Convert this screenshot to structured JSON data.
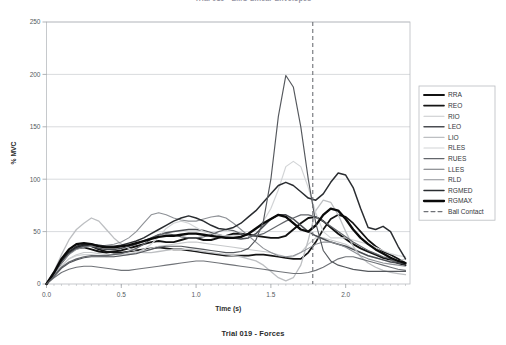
{
  "figure": {
    "top_title": "Trial 019 - EMG Linear Envelopes",
    "bottom_caption": "Trial 019 - Forces"
  },
  "chart_data": {
    "type": "line",
    "title": "Trial 019 - EMG Linear Envelopes",
    "xlabel": "Time (s)",
    "ylabel": "% MVC",
    "xlim": [
      0.0,
      2.43
    ],
    "ylim": [
      0,
      250
    ],
    "xticks": [
      "0.0",
      "0.5",
      "1.0",
      "1.5",
      "2.0"
    ],
    "xtick_values": [
      0.0,
      0.5,
      1.0,
      1.5,
      2.0
    ],
    "yticks": [
      "0",
      "50",
      "100",
      "150",
      "200",
      "250"
    ],
    "ytick_values": [
      0,
      50,
      100,
      150,
      200,
      250
    ],
    "grid": "horizontal",
    "legend_position": "right-outside",
    "annotations": [
      {
        "name": "Ball Contact",
        "type": "vline",
        "x": 1.78,
        "style": "dashed",
        "color": "#6f7277"
      }
    ],
    "x": [
      0.0,
      0.05,
      0.1,
      0.15,
      0.2,
      0.25,
      0.3,
      0.35,
      0.4,
      0.45,
      0.5,
      0.55,
      0.6,
      0.65,
      0.7,
      0.75,
      0.8,
      0.85,
      0.9,
      0.95,
      1.0,
      1.05,
      1.1,
      1.15,
      1.2,
      1.25,
      1.3,
      1.35,
      1.4,
      1.45,
      1.5,
      1.55,
      1.6,
      1.65,
      1.7,
      1.75,
      1.8,
      1.85,
      1.9,
      1.95,
      2.0,
      2.05,
      2.1,
      2.15,
      2.2,
      2.25,
      2.3,
      2.35,
      2.4
    ],
    "series": [
      {
        "name": "RRA",
        "color": "#111111",
        "width": 1.9,
        "values": [
          0,
          10,
          22,
          30,
          34,
          35,
          33,
          31,
          30,
          31,
          32,
          34,
          36,
          38,
          40,
          41,
          40,
          40,
          42,
          44,
          44,
          42,
          42,
          44,
          46,
          48,
          48,
          47,
          46,
          45,
          44,
          44,
          46,
          52,
          58,
          63,
          64,
          60,
          54,
          48,
          43,
          38,
          34,
          31,
          28,
          25,
          23,
          20,
          18
        ]
      },
      {
        "name": "REO",
        "color": "#141414",
        "width": 1.7,
        "values": [
          0,
          9,
          20,
          29,
          35,
          37,
          36,
          33,
          31,
          30,
          30,
          31,
          32,
          33,
          34,
          35,
          34,
          33,
          33,
          32,
          31,
          30,
          29,
          28,
          27,
          27,
          27,
          27,
          28,
          28,
          27,
          26,
          25,
          24,
          24,
          30,
          40,
          52,
          62,
          66,
          64,
          58,
          50,
          42,
          36,
          31,
          28,
          24,
          20
        ]
      },
      {
        "name": "RIO",
        "color": "#c7c9cb",
        "width": 1.1,
        "values": [
          0,
          8,
          17,
          24,
          28,
          30,
          30,
          29,
          28,
          28,
          28,
          29,
          30,
          32,
          34,
          36,
          37,
          38,
          39,
          40,
          40,
          39,
          38,
          37,
          36,
          35,
          34,
          33,
          32,
          31,
          30,
          28,
          26,
          26,
          30,
          38,
          44,
          44,
          42,
          40,
          38,
          34,
          30,
          27,
          25,
          23,
          22,
          22,
          24
        ]
      },
      {
        "name": "LEO",
        "color": "#4a4d52",
        "width": 1.5,
        "values": [
          0,
          10,
          21,
          29,
          34,
          36,
          36,
          34,
          33,
          33,
          34,
          36,
          38,
          41,
          44,
          47,
          49,
          50,
          51,
          52,
          52,
          51,
          49,
          47,
          45,
          44,
          43,
          44,
          48,
          55,
          62,
          66,
          66,
          62,
          56,
          50,
          46,
          43,
          40,
          38,
          36,
          33,
          30,
          27,
          25,
          23,
          21,
          20,
          19
        ]
      },
      {
        "name": "LIO",
        "color": "#bdbfc2",
        "width": 1.3,
        "values": [
          0,
          12,
          28,
          42,
          52,
          58,
          63,
          60,
          52,
          44,
          38,
          34,
          31,
          30,
          30,
          31,
          32,
          33,
          33,
          33,
          32,
          31,
          30,
          29,
          28,
          27,
          26,
          24,
          22,
          18,
          12,
          6,
          3,
          6,
          18,
          42,
          70,
          80,
          78,
          66,
          50,
          36,
          26,
          20,
          16,
          13,
          11,
          10,
          9
        ]
      },
      {
        "name": "RLES",
        "color": "#d2d4d6",
        "width": 1.2,
        "values": [
          0,
          9,
          18,
          24,
          27,
          28,
          28,
          27,
          26,
          26,
          27,
          28,
          30,
          33,
          38,
          45,
          53,
          58,
          60,
          58,
          54,
          50,
          48,
          47,
          46,
          46,
          46,
          48,
          52,
          60,
          72,
          90,
          112,
          117,
          112,
          92,
          68,
          50,
          44,
          44,
          44,
          42,
          40,
          38,
          35,
          32,
          29,
          27,
          26
        ]
      },
      {
        "name": "RUES",
        "color": "#63666b",
        "width": 1.2,
        "values": [
          0,
          8,
          16,
          21,
          24,
          26,
          27,
          27,
          27,
          28,
          29,
          31,
          34,
          38,
          43,
          47,
          48,
          47,
          45,
          44,
          44,
          45,
          47,
          50,
          52,
          51,
          48,
          46,
          46,
          48,
          52,
          56,
          60,
          63,
          66,
          66,
          64,
          60,
          55,
          50,
          45,
          40,
          36,
          32,
          29,
          26,
          24,
          22,
          20
        ]
      },
      {
        "name": "LLES",
        "color": "#707378",
        "width": 1.1,
        "values": [
          0,
          6,
          11,
          14,
          16,
          17,
          17,
          16,
          15,
          14,
          13,
          13,
          14,
          15,
          16,
          17,
          18,
          19,
          20,
          21,
          22,
          22,
          21,
          20,
          19,
          18,
          17,
          16,
          15,
          14,
          13,
          12,
          11,
          10,
          10,
          11,
          13,
          16,
          20,
          24,
          26,
          26,
          24,
          22,
          20,
          18,
          16,
          14,
          13
        ]
      },
      {
        "name": "RLD",
        "color": "#8e9196",
        "width": 1.1,
        "values": [
          0,
          9,
          20,
          28,
          33,
          35,
          36,
          36,
          37,
          38,
          40,
          44,
          50,
          58,
          66,
          68,
          66,
          63,
          61,
          60,
          60,
          62,
          64,
          65,
          63,
          58,
          52,
          46,
          40,
          34,
          30,
          27,
          26,
          27,
          30,
          34,
          38,
          40,
          40,
          38,
          35,
          31,
          27,
          24,
          22,
          20,
          19,
          18,
          17
        ]
      },
      {
        "name": "RGMED",
        "color": "#2a2d31",
        "width": 1.5,
        "values": [
          0,
          10,
          22,
          31,
          36,
          38,
          38,
          37,
          36,
          36,
          37,
          39,
          41,
          44,
          48,
          52,
          56,
          60,
          63,
          65,
          63,
          60,
          56,
          53,
          52,
          54,
          58,
          64,
          70,
          78,
          86,
          94,
          97,
          94,
          88,
          82,
          80,
          86,
          97,
          106,
          104,
          92,
          72,
          54,
          52,
          55,
          50,
          36,
          24
        ]
      },
      {
        "name": "RGMAX",
        "color": "#0a0a0a",
        "width": 2.3,
        "values": [
          0,
          11,
          24,
          33,
          38,
          39,
          38,
          36,
          35,
          35,
          36,
          37,
          39,
          41,
          43,
          45,
          46,
          46,
          47,
          48,
          48,
          47,
          46,
          45,
          44,
          44,
          45,
          48,
          53,
          58,
          62,
          66,
          64,
          58,
          52,
          50,
          56,
          66,
          72,
          70,
          62,
          52,
          44,
          38,
          33,
          29,
          25,
          22,
          20
        ]
      },
      {
        "name": "RIO-peak",
        "color": "#55585d",
        "width": 1.15,
        "hidden_from_legend": true,
        "values": [
          0,
          7,
          15,
          20,
          23,
          25,
          26,
          26,
          26,
          26,
          27,
          28,
          29,
          31,
          33,
          35,
          36,
          36,
          36,
          35,
          34,
          33,
          32,
          31,
          30,
          30,
          31,
          34,
          42,
          60,
          100,
          160,
          199,
          188,
          150,
          100,
          58,
          32,
          22,
          18,
          16,
          14,
          13,
          12,
          12,
          12,
          12,
          12,
          12
        ]
      }
    ],
    "legend_entries": [
      {
        "label": "RRA",
        "color": "#111111",
        "width": 1.9,
        "dashed": false
      },
      {
        "label": "REO",
        "color": "#141414",
        "width": 1.7,
        "dashed": false
      },
      {
        "label": "RIO",
        "color": "#c7c9cb",
        "width": 1.1,
        "dashed": false
      },
      {
        "label": "LEO",
        "color": "#4a4d52",
        "width": 1.5,
        "dashed": false
      },
      {
        "label": "LIO",
        "color": "#bdbfc2",
        "width": 1.3,
        "dashed": false
      },
      {
        "label": "RLES",
        "color": "#d2d4d6",
        "width": 1.2,
        "dashed": false
      },
      {
        "label": "RUES",
        "color": "#63666b",
        "width": 1.2,
        "dashed": false
      },
      {
        "label": "LLES",
        "color": "#707378",
        "width": 1.1,
        "dashed": false
      },
      {
        "label": "RLD",
        "color": "#8e9196",
        "width": 1.1,
        "dashed": false
      },
      {
        "label": "RGMED",
        "color": "#2a2d31",
        "width": 1.5,
        "dashed": false
      },
      {
        "label": "RGMAX",
        "color": "#0a0a0a",
        "width": 2.3,
        "dashed": false
      },
      {
        "label": "Ball Contact",
        "color": "#6f7277",
        "width": 1.1,
        "dashed": true
      }
    ]
  }
}
